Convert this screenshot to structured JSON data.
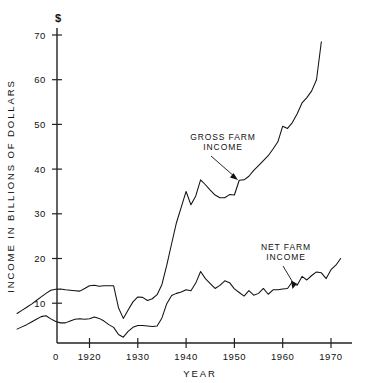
{
  "chart_data": {
    "type": "line",
    "title": "",
    "xlabel": "YEAR",
    "ylabel": "INCOME IN BILLIONS OF DOLLARS",
    "unit_symbol": "$",
    "xlim": [
      1903,
      1976
    ],
    "ylim": [
      0,
      73
    ],
    "grid": false,
    "legend_position": "inline-annotations",
    "xticks": [
      0,
      1920,
      1930,
      1940,
      1950,
      1960,
      1970
    ],
    "xtick_labels": [
      "0",
      "1920",
      "1930",
      "1940",
      "1950",
      "1960",
      "1970"
    ],
    "yticks": [
      10,
      20,
      30,
      40,
      50,
      60,
      70
    ],
    "ytick_labels": [
      "10",
      "20",
      "30",
      "40",
      "50",
      "60",
      "70"
    ],
    "x": [
      1905,
      1906,
      1907,
      1908,
      1909,
      1910,
      1911,
      1912,
      1913,
      1914,
      1915,
      1916,
      1917,
      1918,
      1919,
      1920,
      1921,
      1922,
      1923,
      1924,
      1925,
      1926,
      1927,
      1928,
      1929,
      1930,
      1931,
      1932,
      1933,
      1934,
      1935,
      1936,
      1937,
      1938,
      1939,
      1940,
      1941,
      1942,
      1943,
      1944,
      1945,
      1946,
      1947,
      1948,
      1949,
      1950,
      1951,
      1952,
      1953,
      1954,
      1955,
      1956,
      1957,
      1958,
      1959,
      1960,
      1961,
      1962,
      1963,
      1964,
      1965,
      1966,
      1967,
      1968,
      1969,
      1970,
      1971,
      1972
    ],
    "series": [
      {
        "name": "GROSS FARM INCOME",
        "values": [
          7.7,
          8.4,
          9.1,
          9.8,
          10.6,
          11.4,
          12.2,
          12.9,
          13.1,
          13.2,
          13.0,
          12.9,
          12.8,
          12.7,
          13.3,
          13.9,
          14.0,
          13.8,
          13.9,
          13.9,
          13.9,
          9.0,
          6.6,
          8.5,
          10.3,
          11.4,
          11.3,
          10.6,
          11.0,
          11.9,
          14.2,
          18.5,
          23.3,
          28.0,
          31.5,
          35.0,
          32.0,
          34.0,
          37.6,
          36.5,
          35.3,
          34.2,
          33.6,
          33.6,
          34.3,
          34.2,
          37.5,
          37.6,
          38.4,
          39.7,
          40.8,
          41.9,
          43.0,
          44.5,
          46.1,
          49.6,
          49.1,
          50.4,
          52.4,
          54.8,
          56.0,
          57.5,
          60.0,
          68.5,
          13.5,
          13.2,
          13.0,
          13.0
        ],
        "note": "Upper curve: rises from ~7.7 in 1905 to ~68.5 at the right edge (1972), with a 1932 trough near 6.6 and a 1947-48 plateau near 34-38"
      },
      {
        "name": "NET FARM INCOME",
        "values": [
          4.2,
          4.7,
          5.2,
          5.8,
          6.4,
          7.0,
          7.2,
          6.5,
          5.9,
          5.6,
          5.6,
          6.0,
          6.4,
          6.5,
          6.4,
          6.5,
          6.9,
          6.6,
          6.0,
          5.2,
          4.6,
          3.0,
          2.4,
          3.7,
          4.6,
          5.0,
          5.0,
          4.9,
          4.8,
          4.9,
          6.7,
          9.9,
          11.7,
          12.2,
          12.5,
          13.0,
          12.8,
          14.5,
          17.1,
          15.5,
          14.4,
          13.3,
          14.0,
          15.0,
          14.6,
          13.2,
          12.4,
          11.6,
          12.8,
          11.8,
          12.2,
          13.3,
          12.0,
          13.0,
          13.0,
          13.2,
          13.3,
          14.8,
          14.0,
          16.0,
          15.2,
          16.2,
          17.0,
          16.8,
          15.5,
          17.5,
          18.5,
          20.0
        ],
        "note": "Lower curve: starts ~4.2 in 1905, trough ~2.4 in 1932, peak ~17 in 1947, ends ~20 in 1972"
      }
    ],
    "annotations": [
      {
        "id": "gross-annotation",
        "label_lines": [
          "GROSS FARM",
          "INCOME"
        ],
        "points_to_series": "GROSS FARM INCOME",
        "points_to_year": 1950,
        "points_to_value": 37.6
      },
      {
        "id": "net-annotation",
        "label_lines": [
          "NET FARM",
          "INCOME"
        ],
        "points_to_series": "NET FARM INCOME",
        "points_to_year": 1963,
        "points_to_value": 13.3
      }
    ]
  },
  "figure": {
    "background_color": "#ffffff",
    "line_color": "#111111",
    "axis_color": "#222222"
  }
}
